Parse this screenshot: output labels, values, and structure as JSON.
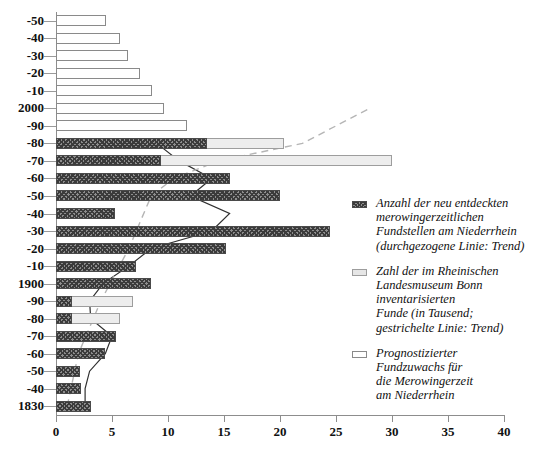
{
  "chart_data": {
    "type": "bar",
    "orientation": "horizontal",
    "title": "",
    "xlabel": "",
    "ylabel": "",
    "xlim": [
      0,
      40
    ],
    "xticks": [
      0,
      5,
      10,
      15,
      20,
      25,
      30,
      35,
      40
    ],
    "grid": false,
    "legend_position": "right",
    "categories": [
      "1830",
      "-40",
      "-50",
      "-60",
      "-70",
      "-80",
      "-90",
      "1900",
      "-10",
      "-20",
      "-30",
      "-40",
      "-50",
      "-60",
      "-70",
      "-80",
      "-90",
      "2000",
      "-10",
      "-20",
      "-30",
      "-40",
      "-50"
    ],
    "series": [
      {
        "name": "Anzahl der neu entdeckten merowingerzeitlichen Fundstellen am Niederrhein",
        "key": "dark",
        "color": "#3b3b3b",
        "values": [
          3.1,
          2.2,
          2.1,
          4.4,
          5.4,
          1.4,
          1.4,
          8.5,
          7.1,
          15.2,
          24.5,
          5.3,
          20.0,
          15.5,
          9.4,
          13.5,
          0,
          0,
          0,
          0,
          0,
          0,
          0
        ]
      },
      {
        "name": "Zahl der im Rheinischen Landesmuseum Bonn inventarisierten Funde (in Tausend)",
        "key": "grey",
        "color": "#ededed",
        "values": [
          0,
          0,
          0,
          0,
          0,
          5.7,
          6.9,
          0,
          0,
          0,
          0,
          0,
          0,
          0,
          30.0,
          20.4,
          0,
          0,
          0,
          0,
          0,
          0,
          0
        ]
      },
      {
        "name": "Prognostizierter Fundzuwachs fuer die Merowingerzeit am Niederrhein",
        "key": "prog",
        "color": "#ffffff",
        "values": [
          0,
          0,
          0,
          0,
          1.9,
          0,
          0,
          0,
          0,
          0,
          0,
          0,
          0,
          0,
          0,
          0,
          11.7,
          9.6,
          8.6,
          7.5,
          6.4,
          5.7,
          4.5
        ]
      }
    ],
    "trend_lines": [
      {
        "name": "durchgezogene Linie: Trend",
        "style": "solid",
        "color": "#303030",
        "points": [
          [
            2.6,
            "1830"
          ],
          [
            2.6,
            "-40"
          ],
          [
            3.0,
            "-50"
          ],
          [
            4.4,
            "-60"
          ],
          [
            5.0,
            "-70"
          ],
          [
            3.1,
            "-80"
          ],
          [
            3.0,
            "-90"
          ],
          [
            4.2,
            "1900"
          ],
          [
            6.5,
            "-10"
          ],
          [
            8.5,
            "-20"
          ],
          [
            13.9,
            "-30"
          ],
          [
            15.5,
            "-40"
          ],
          [
            12.0,
            "-50"
          ],
          [
            13.9,
            "-60"
          ],
          [
            11.0,
            "-70"
          ],
          [
            9.0,
            "-80"
          ]
        ]
      },
      {
        "name": "gestrichelte Linie: Trend",
        "style": "dashed",
        "color": "#b5b5b5",
        "points": [
          [
            1.0,
            "1830"
          ],
          [
            2.0,
            "-60"
          ],
          [
            4.0,
            "-90"
          ],
          [
            6.5,
            "-20"
          ],
          [
            8.5,
            "-50"
          ],
          [
            10.5,
            "-60"
          ],
          [
            14.5,
            "-70"
          ],
          [
            22.0,
            "-80"
          ],
          [
            28.0,
            "2000"
          ]
        ]
      }
    ]
  },
  "axis": {
    "x_labels": [
      "0",
      "5",
      "10",
      "15",
      "20",
      "25",
      "30",
      "35",
      "40"
    ],
    "y_labels": [
      "-50",
      "-40",
      "-30",
      "-20",
      "-10",
      "2000",
      "-90",
      "-80",
      "-70",
      "-60",
      "-50",
      "-40",
      "-30",
      "-20",
      "-10",
      "1900",
      "-90",
      "-80",
      "-70",
      "-60",
      "-50",
      "-40",
      "1830"
    ]
  },
  "legend": {
    "items": [
      {
        "swatch": "dark",
        "lines": [
          "Anzahl der neu entdeckten",
          "merowingerzeitlichen",
          "Fundstellen am Niederrhein",
          "(durchgezogene Linie: Trend)"
        ]
      },
      {
        "swatch": "grey",
        "lines": [
          "Zahl der im Rheinischen",
          "Landesmuseum Bonn",
          "inventarisierten",
          "Funde (in Tausend;",
          "gestrichelte Linie: Trend)"
        ]
      },
      {
        "swatch": "prog",
        "lines": [
          "Prognostizierter",
          "Fundzuwachs für",
          "die Merowingerzeit",
          "am Niederrhein"
        ]
      }
    ]
  }
}
